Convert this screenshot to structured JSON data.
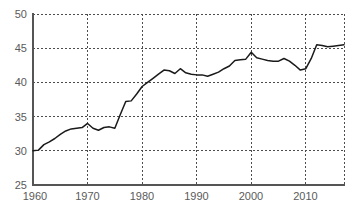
{
  "chart_data": {
    "type": "line",
    "title": "",
    "subtitle": "",
    "xlabel": "",
    "ylabel": "",
    "xlim": [
      1960,
      2017
    ],
    "ylim": [
      25,
      50
    ],
    "grid": true,
    "legend": null,
    "legend_position": "none",
    "y_ticks": [
      25,
      30,
      35,
      40,
      45,
      50
    ],
    "x_ticks": [
      1960,
      1970,
      1980,
      1990,
      2000,
      2010
    ],
    "series": [
      {
        "name": "value",
        "color": "#1a1a1a",
        "x": [
          1960,
          1961,
          1962,
          1963,
          1964,
          1965,
          1966,
          1967,
          1968,
          1969,
          1970,
          1971,
          1972,
          1973,
          1974,
          1975,
          1976,
          1977,
          1978,
          1979,
          1980,
          1981,
          1982,
          1983,
          1984,
          1985,
          1986,
          1987,
          1988,
          1989,
          1990,
          1991,
          1992,
          1993,
          1994,
          1995,
          1996,
          1997,
          1998,
          1999,
          2000,
          2001,
          2002,
          2003,
          2004,
          2005,
          2006,
          2007,
          2008,
          2009,
          2010,
          2011,
          2012,
          2013,
          2014,
          2015,
          2016,
          2017
        ],
        "values": [
          30.0,
          30.1,
          30.9,
          31.3,
          31.8,
          32.4,
          32.9,
          33.2,
          33.3,
          33.4,
          34.0,
          33.3,
          33.0,
          33.4,
          33.5,
          33.3,
          35.3,
          37.2,
          37.3,
          38.3,
          39.4,
          40.0,
          40.6,
          41.2,
          41.8,
          41.7,
          41.3,
          42.0,
          41.4,
          41.2,
          41.1,
          41.1,
          40.9,
          41.2,
          41.5,
          42.0,
          42.4,
          43.2,
          43.3,
          43.4,
          44.4,
          43.6,
          43.4,
          43.2,
          43.1,
          43.1,
          43.5,
          43.1,
          42.5,
          41.8,
          42.0,
          43.5,
          45.5,
          45.4,
          45.2,
          45.3,
          45.4,
          45.5
        ]
      }
    ]
  },
  "axes": {
    "y_tick_labels": [
      "50",
      "45",
      "40",
      "35",
      "30",
      "25"
    ],
    "x_tick_labels": [
      "1960",
      "1970",
      "1980",
      "1990",
      "2000",
      "2010"
    ]
  },
  "colors": {
    "line": "#1a1a1a",
    "grid": "#4d4d4d",
    "axis": "#555555",
    "tick_text": "#5a5a5a",
    "background": "#ffffff"
  },
  "footer": {
    "artifact_text": ""
  }
}
